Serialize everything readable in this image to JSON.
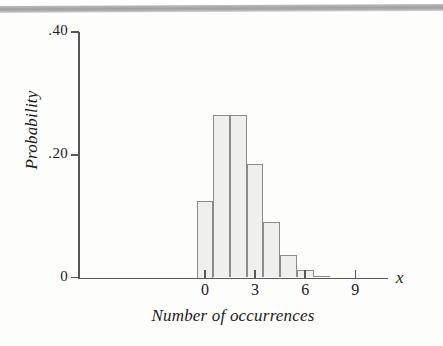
{
  "chart_data": {
    "type": "bar",
    "title": "",
    "subtitle": "",
    "xlabel": "Number of occurrences",
    "ylabel": "Probability",
    "axis_variable_label": "x",
    "categories": [
      0,
      1,
      2,
      3,
      4,
      5,
      6,
      7
    ],
    "values": [
      0.125,
      0.264,
      0.264,
      0.185,
      0.091,
      0.036,
      0.013,
      0.003
    ],
    "x": [
      0,
      1,
      2,
      3,
      4,
      5,
      6,
      7
    ],
    "xlim": [
      -7,
      11
    ],
    "ylim": [
      0,
      0.4
    ],
    "x_tick_labels": [
      "0",
      "3",
      "6",
      "9"
    ],
    "x_tick_values": [
      0,
      3,
      6,
      9
    ],
    "y_tick_labels": [
      ".40",
      ".20",
      "0"
    ],
    "y_tick_values": [
      0.4,
      0.2,
      0
    ],
    "grid": false,
    "legend": null,
    "bar_fill_color": "#efefec",
    "bar_border_color": "#8b8b8b",
    "axis_color": "#58585a",
    "text_color": "#1b1b1b",
    "background_color": "#fdfdfc"
  },
  "figure": {
    "ytitle": "Probability",
    "xtitle": "Number of occurrences",
    "xvar": "x"
  }
}
